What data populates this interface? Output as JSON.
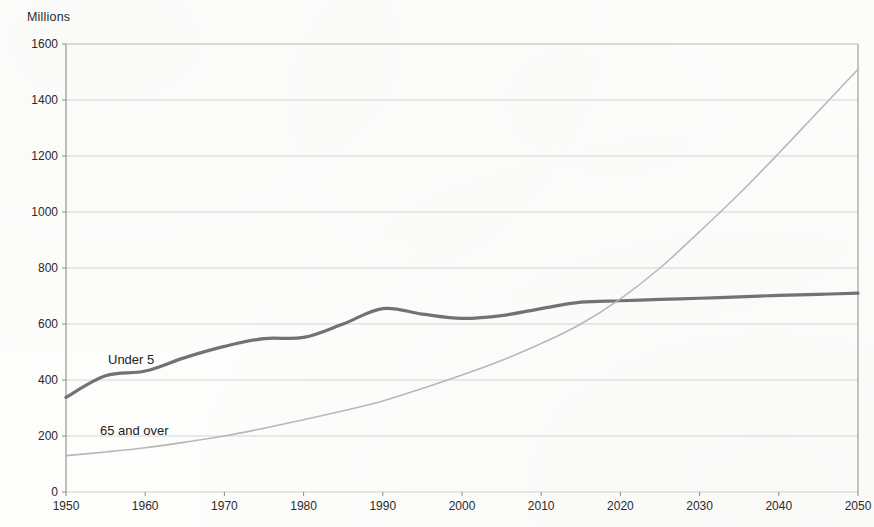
{
  "axis_title": "Millions",
  "series_labels": [
    {
      "text": "Under 5",
      "x": 108,
      "y": 352
    },
    {
      "text": "65 and over",
      "x": 100,
      "y": 423
    }
  ],
  "chart_data": {
    "type": "line",
    "title": "",
    "subtitle": "",
    "xlabel": "",
    "ylabel": "Millions",
    "xlim": [
      1950,
      2050
    ],
    "ylim": [
      0,
      1600
    ],
    "xticks": [
      1950,
      1960,
      1970,
      1980,
      1990,
      2000,
      2010,
      2020,
      2030,
      2040,
      2050
    ],
    "yticks": [
      0,
      200,
      400,
      600,
      800,
      1000,
      1200,
      1400,
      1600
    ],
    "grid": "horizontal",
    "legend": "inline-annotations",
    "colors": {
      "under_5": "#6a6a6a",
      "over_65": "#b4b4b4",
      "grid": "#c8c8c4",
      "axis": "#8a8a86",
      "text": "#2b2b2b",
      "background": "#fdfdfc"
    },
    "x": [
      1950,
      1955,
      1960,
      1965,
      1970,
      1975,
      1980,
      1985,
      1990,
      1995,
      2000,
      2005,
      2010,
      2015,
      2020,
      2025,
      2030,
      2035,
      2040,
      2045,
      2050
    ],
    "series": [
      {
        "name": "Under 5",
        "color": "#6a6a6a",
        "width": 3.2,
        "values": [
          338,
          415,
          432,
          480,
          520,
          548,
          552,
          600,
          655,
          635,
          620,
          630,
          655,
          678,
          683,
          688,
          692,
          697,
          702,
          706,
          710
        ]
      },
      {
        "name": "65 and over",
        "color": "#b4b4b4",
        "width": 1.6,
        "values": [
          130,
          143,
          158,
          178,
          200,
          228,
          258,
          290,
          325,
          370,
          418,
          470,
          530,
          600,
          690,
          800,
          930,
          1065,
          1210,
          1360,
          1510
        ]
      }
    ],
    "annotations": [
      {
        "text": "Under 5",
        "x": 1957,
        "y": 455
      },
      {
        "text": "65 and over",
        "x": 1956,
        "y": 230
      }
    ]
  }
}
